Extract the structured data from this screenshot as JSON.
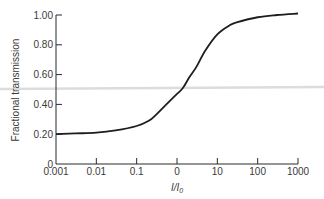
{
  "chart_data": {
    "type": "line",
    "title": "",
    "xlabel": "I/I0",
    "xlabel_main": "I/I",
    "xlabel_sub": "0",
    "ylabel": "Fractional transmission",
    "xscale": "log",
    "xlim": [
      0.001,
      1000
    ],
    "ylim": [
      0,
      1.0
    ],
    "grid": false,
    "legend": null,
    "x_ticks": [
      0.001,
      0.01,
      0.1,
      1,
      10,
      100,
      1000
    ],
    "x_tick_labels": [
      "0.001",
      "0.01",
      "0.1",
      "0",
      "10",
      "100",
      "1000"
    ],
    "y_ticks": [
      0,
      0.2,
      0.4,
      0.6,
      0.8,
      1.0
    ],
    "y_tick_labels": [
      "0",
      "0.20",
      "0.40",
      "0.60",
      "0.80",
      "1.00"
    ],
    "series": [
      {
        "name": "Fractional transmission",
        "color": "#1e1e1e",
        "x": [
          0.001,
          0.003,
          0.01,
          0.03,
          0.1,
          0.2,
          0.3,
          0.5,
          1,
          1.4,
          2,
          3,
          5,
          10,
          20,
          30,
          100,
          300,
          1000
        ],
        "y": [
          0.2,
          0.205,
          0.21,
          0.225,
          0.255,
          0.29,
          0.33,
          0.39,
          0.47,
          0.51,
          0.58,
          0.65,
          0.76,
          0.87,
          0.93,
          0.95,
          0.985,
          1.0,
          1.01
        ]
      }
    ]
  }
}
